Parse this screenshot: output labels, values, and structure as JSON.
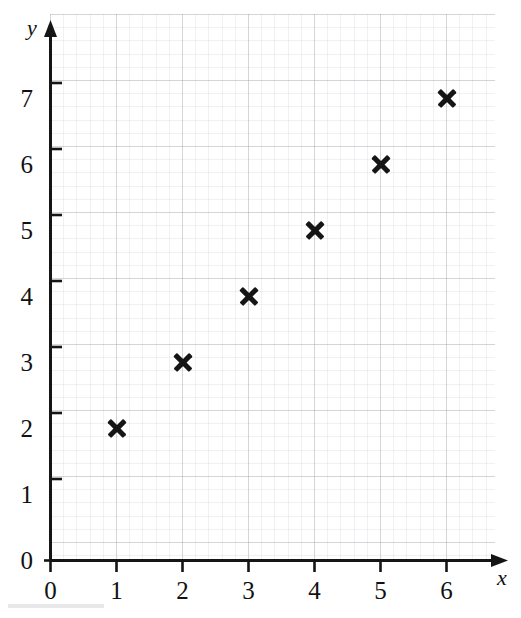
{
  "figure": {
    "background_color": "#ffffff",
    "ink_color": "#151515",
    "grid_color": "#b4b4be"
  },
  "chart_data": {
    "type": "scatter",
    "title": "",
    "xlabel": "x",
    "ylabel": "y",
    "x": [
      1,
      2,
      3,
      4,
      5,
      6
    ],
    "y": [
      2,
      3,
      4,
      5,
      6,
      7
    ],
    "points": [
      {
        "x": 1,
        "y": 2
      },
      {
        "x": 2,
        "y": 3
      },
      {
        "x": 3,
        "y": 4
      },
      {
        "x": 4,
        "y": 5
      },
      {
        "x": 5,
        "y": 6
      },
      {
        "x": 6,
        "y": 7
      }
    ],
    "marker": "x-cross",
    "marker_color": "#151515",
    "xlim": [
      0,
      6.75
    ],
    "ylim": [
      0,
      8.27
    ],
    "xticks": [
      0,
      1,
      2,
      3,
      4,
      5,
      6
    ],
    "xtick_labels": [
      "0",
      "1",
      "2",
      "3",
      "4",
      "5",
      "6"
    ],
    "yticks": [
      0,
      1,
      2,
      3,
      4,
      5,
      6,
      7
    ],
    "ytick_labels": [
      "0",
      "1",
      "2",
      "3",
      "4",
      "5",
      "6",
      "7"
    ],
    "grid": true,
    "minor_grid": true,
    "minor_divisions_per_unit": 5,
    "legend": null,
    "axis_arrows": true
  },
  "axes": {
    "x_axis_label": "x",
    "y_axis_label": "y"
  }
}
